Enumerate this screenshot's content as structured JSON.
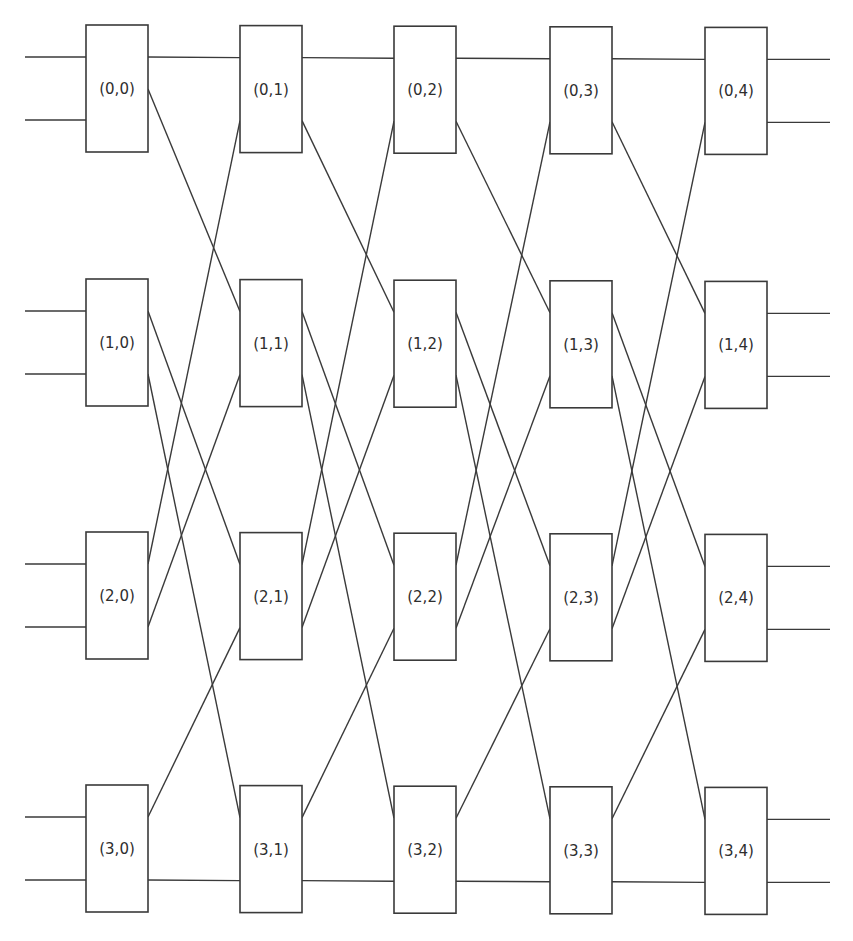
{
  "diagram": {
    "type": "butterfly-network",
    "rows": 4,
    "columns": 5,
    "nodes": [
      [
        {
          "label": "(0,0)"
        },
        {
          "label": "(0,1)"
        },
        {
          "label": "(0,2)"
        },
        {
          "label": "(0,3)"
        },
        {
          "label": "(0,4)"
        }
      ],
      [
        {
          "label": "(1,0)"
        },
        {
          "label": "(1,1)"
        },
        {
          "label": "(1,2)"
        },
        {
          "label": "(1,3)"
        },
        {
          "label": "(1,4)"
        }
      ],
      [
        {
          "label": "(2,0)"
        },
        {
          "label": "(2,1)"
        },
        {
          "label": "(2,2)"
        },
        {
          "label": "(2,3)"
        },
        {
          "label": "(2,4)"
        }
      ],
      [
        {
          "label": "(3,0)"
        },
        {
          "label": "(3,1)"
        },
        {
          "label": "(3,2)"
        },
        {
          "label": "(3,3)"
        },
        {
          "label": "(3,4)"
        }
      ]
    ],
    "stage_connections": [
      {
        "from": [
          0,
          "out1"
        ],
        "to": [
          0,
          "in0"
        ]
      },
      {
        "from": [
          0,
          "out2"
        ],
        "to": [
          1,
          "in0"
        ]
      },
      {
        "from": [
          1,
          "out0"
        ],
        "to": [
          2,
          "in0"
        ]
      },
      {
        "from": [
          1,
          "out1"
        ],
        "to": [
          3,
          "in0"
        ]
      },
      {
        "from": [
          2,
          "out0"
        ],
        "to": [
          0,
          "in1"
        ]
      },
      {
        "from": [
          2,
          "out1"
        ],
        "to": [
          1,
          "in1"
        ]
      },
      {
        "from": [
          3,
          "out0"
        ],
        "to": [
          2,
          "in1"
        ]
      },
      {
        "from": [
          3,
          "out1"
        ],
        "to": [
          3,
          "in1"
        ]
      }
    ],
    "colors": {
      "line": "#3a3a3a",
      "text": "#2e2e2e",
      "background": "#ffffff"
    }
  }
}
